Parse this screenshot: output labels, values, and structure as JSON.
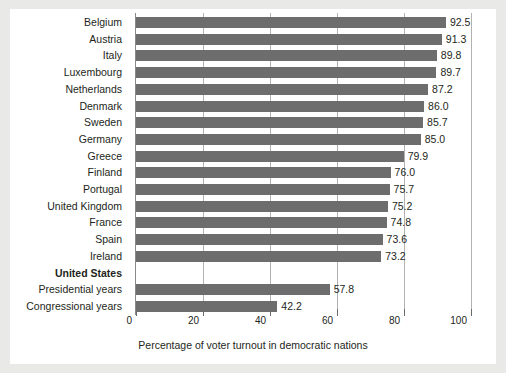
{
  "chart_data": {
    "type": "bar",
    "orientation": "horizontal",
    "title": "",
    "xlabel": "Percentage of voter turnout in democratic nations",
    "ylabel": "",
    "xlim": [
      0,
      100
    ],
    "xticks": [
      "0",
      "20",
      "40",
      "60",
      "80",
      "100"
    ],
    "xtick_values": [
      0,
      20,
      40,
      60,
      80,
      100
    ],
    "grid": true,
    "grid_axis": "x",
    "legend": "none",
    "bar_color": "#6d6d6d",
    "categories": [
      "Belgium",
      "Austria",
      "Italy",
      "Luxembourg",
      "Netherlands",
      "Denmark",
      "Sweden",
      "Germany",
      "Greece",
      "Finland",
      "Portugal",
      "United Kingdom",
      "France",
      "Spain",
      "Ireland",
      "United States",
      "Presidential years",
      "Congressional years"
    ],
    "values": [
      92.5,
      91.3,
      89.8,
      89.7,
      87.2,
      86.0,
      85.7,
      85.0,
      79.9,
      76.0,
      75.7,
      75.2,
      74.8,
      73.6,
      73.2,
      null,
      57.8,
      42.2
    ],
    "value_labels": [
      "92.5",
      "91.3",
      "89.8",
      "89.7",
      "87.2",
      "86.0",
      "85.7",
      "85.0",
      "79.9",
      "76.0",
      "75.7",
      "75.2",
      "74.8",
      "73.6",
      "73.2",
      "",
      "57.8",
      "42.2"
    ],
    "rows": [
      {
        "label": "Belgium",
        "value": 92.5,
        "value_label": "92.5",
        "style": "normal"
      },
      {
        "label": "Austria",
        "value": 91.3,
        "value_label": "91.3",
        "style": "normal"
      },
      {
        "label": "Italy",
        "value": 89.8,
        "value_label": "89.8",
        "style": "normal"
      },
      {
        "label": "Luxembourg",
        "value": 89.7,
        "value_label": "89.7",
        "style": "normal"
      },
      {
        "label": "Netherlands",
        "value": 87.2,
        "value_label": "87.2",
        "style": "normal"
      },
      {
        "label": "Denmark",
        "value": 86.0,
        "value_label": "86.0",
        "style": "normal"
      },
      {
        "label": "Sweden",
        "value": 85.7,
        "value_label": "85.7",
        "style": "normal"
      },
      {
        "label": "Germany",
        "value": 85.0,
        "value_label": "85.0",
        "style": "normal"
      },
      {
        "label": "Greece",
        "value": 79.9,
        "value_label": "79.9",
        "style": "normal"
      },
      {
        "label": "Finland",
        "value": 76.0,
        "value_label": "76.0",
        "style": "normal"
      },
      {
        "label": "Portugal",
        "value": 75.7,
        "value_label": "75.7",
        "style": "normal"
      },
      {
        "label": "United Kingdom",
        "value": 75.2,
        "value_label": "75.2",
        "style": "normal"
      },
      {
        "label": "France",
        "value": 74.8,
        "value_label": "74.8",
        "style": "normal"
      },
      {
        "label": "Spain",
        "value": 73.6,
        "value_label": "73.6",
        "style": "normal"
      },
      {
        "label": "Ireland",
        "value": 73.2,
        "value_label": "73.2",
        "style": "normal"
      },
      {
        "label": "United States",
        "value": null,
        "value_label": "",
        "style": "header"
      },
      {
        "label": "Presidential years",
        "value": 57.8,
        "value_label": "57.8",
        "style": "indent"
      },
      {
        "label": "Congressional years",
        "value": 42.2,
        "value_label": "42.2",
        "style": "indent"
      }
    ]
  }
}
